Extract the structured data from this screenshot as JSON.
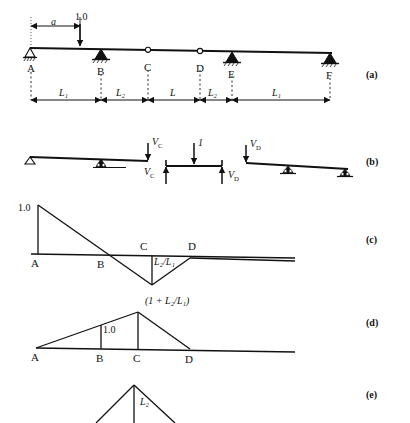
{
  "figure": {
    "type": "structural-influence-line-diagram",
    "panels": [
      {
        "tag": "(a)",
        "name": "beam-layout"
      },
      {
        "tag": "(b)",
        "name": "free-body-segments"
      },
      {
        "tag": "(c)",
        "name": "influence-line-c"
      },
      {
        "tag": "(d)",
        "name": "influence-line-d"
      },
      {
        "tag": "(e)",
        "name": "influence-line-e"
      }
    ]
  },
  "panel_a": {
    "nodes": [
      "A",
      "B",
      "C",
      "D",
      "E",
      "F"
    ],
    "load_label": "1.0",
    "offset_label": "a",
    "dimensions": [
      "L₁",
      "L₂",
      "L",
      "L₂",
      "L₁"
    ],
    "supports": [
      "A",
      "B",
      "E",
      "F"
    ],
    "hinges": [
      "C",
      "D"
    ]
  },
  "panel_b": {
    "forces_top": [
      "Vᴄ",
      "1",
      "Vᴅ"
    ],
    "forces_bottom": [
      "Vᴄ",
      "Vᴅ"
    ],
    "labels": {
      "vc_top": "V",
      "vc_sub": "C",
      "unit_load": "1",
      "vd_top": "V",
      "vd_sub": "D"
    }
  },
  "panel_c": {
    "peak_label": "1.0",
    "dip_label": "L₂/L₁",
    "nodes": [
      "A",
      "B",
      "C",
      "D"
    ]
  },
  "panel_d": {
    "peak_label": "(1 + L₂/L₁)",
    "mid_label": "1.0",
    "nodes": [
      "A",
      "B",
      "C",
      "D"
    ]
  },
  "panel_e": {
    "peak_label": "L₂"
  },
  "colors": {
    "ink": "#111111",
    "paper": "#ffffff"
  }
}
